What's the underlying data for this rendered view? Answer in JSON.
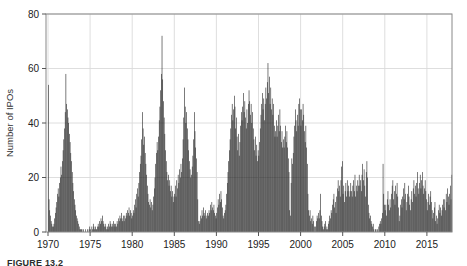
{
  "figure": {
    "caption_label": "FIGURE 13.2"
  },
  "chart_data": {
    "type": "bar",
    "title": "",
    "xlabel": "",
    "ylabel": "Number of IPOs",
    "frequency": "monthly",
    "x_start_year": 1970,
    "x_end_year": 2017,
    "ylim": [
      0,
      80
    ],
    "yticks": [
      0,
      20,
      40,
      60,
      80
    ],
    "xticks": [
      1970,
      1975,
      1980,
      1985,
      1990,
      1995,
      2000,
      2005,
      2010,
      2015
    ],
    "grid": true,
    "legend": "none",
    "bar_color": "#1c1c1c",
    "frame_color": "#888888",
    "grid_color": "#dadada",
    "tick_label_color": "#222222",
    "values": [
      54,
      12,
      8,
      6,
      4,
      3,
      2,
      2,
      3,
      5,
      7,
      9,
      11,
      14,
      16,
      13,
      18,
      20,
      24,
      21,
      26,
      30,
      34,
      38,
      44,
      58,
      47,
      45,
      42,
      40,
      36,
      33,
      29,
      26,
      22,
      18,
      15,
      12,
      10,
      8,
      6,
      5,
      4,
      3,
      2,
      1,
      1,
      1,
      1,
      0,
      1,
      0,
      0,
      1,
      0,
      0,
      1,
      0,
      1,
      2,
      1,
      0,
      2,
      1,
      3,
      2,
      1,
      2,
      1,
      1,
      2,
      3,
      2,
      4,
      3,
      5,
      4,
      6,
      4,
      3,
      2,
      3,
      2,
      1,
      2,
      1,
      3,
      2,
      4,
      3,
      2,
      3,
      2,
      4,
      3,
      2,
      3,
      2,
      4,
      3,
      5,
      4,
      6,
      5,
      7,
      5,
      4,
      6,
      4,
      6,
      5,
      7,
      6,
      8,
      7,
      9,
      6,
      8,
      7,
      5,
      6,
      8,
      7,
      10,
      12,
      9,
      14,
      16,
      13,
      18,
      22,
      25,
      28,
      34,
      44,
      38,
      32,
      35,
      29,
      25,
      21,
      17,
      14,
      11,
      10,
      12,
      9,
      11,
      8,
      10,
      13,
      16,
      20,
      25,
      29,
      33,
      30,
      35,
      41,
      46,
      52,
      58,
      72,
      56,
      48,
      42,
      36,
      30,
      26,
      22,
      19,
      21,
      17,
      19,
      15,
      17,
      13,
      15,
      11,
      13,
      14,
      17,
      13,
      19,
      16,
      21,
      18,
      23,
      20,
      25,
      22,
      27,
      34,
      42,
      53,
      46,
      40,
      44,
      38,
      34,
      30,
      26,
      23,
      20,
      21,
      24,
      28,
      34,
      44,
      37,
      31,
      27,
      22,
      12,
      4,
      3,
      4,
      6,
      5,
      8,
      6,
      9,
      7,
      6,
      8,
      5,
      6,
      7,
      6,
      8,
      7,
      10,
      8,
      11,
      9,
      8,
      10,
      7,
      6,
      5,
      7,
      9,
      12,
      10,
      14,
      11,
      15,
      12,
      9,
      6,
      5,
      7,
      8,
      10,
      14,
      18,
      22,
      26,
      30,
      34,
      38,
      43,
      47,
      41,
      45,
      50,
      46,
      38,
      42,
      35,
      30,
      36,
      28,
      33,
      39,
      44,
      41,
      46,
      51,
      44,
      48,
      42,
      38,
      45,
      40,
      47,
      52,
      48,
      43,
      47,
      40,
      44,
      38,
      34,
      30,
      35,
      28,
      32,
      26,
      30,
      28,
      33,
      38,
      43,
      47,
      51,
      45,
      49,
      41,
      47,
      53,
      49,
      55,
      62,
      51,
      57,
      47,
      53,
      45,
      49,
      43,
      47,
      39,
      35,
      37,
      41,
      35,
      39,
      43,
      37,
      45,
      39,
      33,
      37,
      31,
      34,
      31,
      35,
      39,
      33,
      37,
      31,
      27,
      22,
      8,
      6,
      18,
      27,
      25,
      29,
      35,
      39,
      45,
      41,
      37,
      43,
      39,
      47,
      49,
      45,
      39,
      45,
      41,
      47,
      43,
      37,
      33,
      39,
      31,
      25,
      14,
      8,
      6,
      8,
      4,
      5,
      3,
      6,
      4,
      2,
      0,
      2,
      4,
      6,
      5,
      7,
      5,
      8,
      14,
      6,
      4,
      2,
      1,
      2,
      3,
      4,
      1,
      2,
      1,
      3,
      4,
      6,
      5,
      8,
      7,
      10,
      12,
      14,
      9,
      11,
      7,
      13,
      16,
      19,
      15,
      17,
      13,
      19,
      24,
      26,
      14,
      17,
      11,
      15,
      18,
      13,
      19,
      15,
      17,
      13,
      15,
      18,
      15,
      13,
      17,
      19,
      15,
      21,
      13,
      17,
      15,
      19,
      17,
      21,
      17,
      19,
      15,
      21,
      25,
      19,
      23,
      17,
      13,
      22,
      26,
      20,
      10,
      7,
      5,
      6,
      4,
      3,
      2,
      3,
      1,
      0,
      1,
      1,
      0,
      1,
      0,
      2,
      3,
      4,
      3,
      5,
      7,
      25,
      14,
      10,
      8,
      10,
      6,
      12,
      15,
      10,
      8,
      12,
      9,
      14,
      17,
      19,
      12,
      15,
      10,
      17,
      14,
      18,
      13,
      9,
      4,
      6,
      10,
      12,
      9,
      13,
      16,
      12,
      18,
      14,
      8,
      11,
      14,
      17,
      13,
      10,
      8,
      12,
      15,
      11,
      16,
      19,
      14,
      17,
      13,
      18,
      22,
      16,
      14,
      18,
      21,
      16,
      19,
      22,
      17,
      14,
      16,
      19,
      15,
      12,
      8,
      11,
      14,
      10,
      13,
      15,
      11,
      8,
      5,
      7,
      9,
      11,
      4,
      6,
      3,
      5,
      8,
      10,
      7,
      9,
      6,
      8,
      10,
      12,
      9,
      12,
      8,
      14,
      11,
      16,
      13,
      10,
      14,
      17,
      12,
      21
    ]
  }
}
